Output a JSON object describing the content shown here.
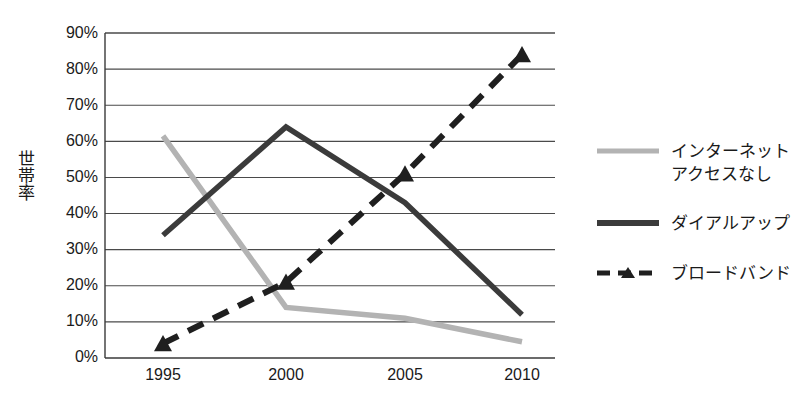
{
  "chart_data": {
    "type": "line",
    "title": "",
    "xlabel": "",
    "ylabel": "世帯率",
    "categories": [
      "1995",
      "2000",
      "2005",
      "2010"
    ],
    "ylim": [
      0,
      90
    ],
    "ytick_labels": [
      "0%",
      "10%",
      "20%",
      "30%",
      "40%",
      "50%",
      "60%",
      "70%",
      "80%",
      "90%"
    ],
    "ytick_values": [
      0,
      10,
      20,
      30,
      40,
      50,
      60,
      70,
      80,
      90
    ],
    "grid": "horizontal",
    "legend_position": "right",
    "value_suffix": "%",
    "series": [
      {
        "name": "インターネット\nアクセスなし",
        "name_flat": "インターネットアクセスなし",
        "color": "#b3b3b3",
        "style": "solid",
        "marker": "none",
        "values": [
          61.5,
          14,
          11,
          4.5
        ]
      },
      {
        "name": "ダイアルアップ",
        "name_flat": "ダイアルアップ",
        "color": "#3b3b3b",
        "style": "solid",
        "marker": "none",
        "values": [
          34,
          64,
          43,
          12
        ]
      },
      {
        "name": "ブロードバンド",
        "name_flat": "ブロードバンド",
        "color": "#1f1f1f",
        "style": "dashed",
        "marker": "triangle",
        "values": [
          4,
          21,
          51,
          84
        ]
      }
    ]
  },
  "axis": {
    "x_labels": [
      "1995",
      "2000",
      "2005",
      "2010"
    ],
    "y_labels": [
      "90%",
      "80%",
      "70%",
      "60%",
      "50%",
      "40%",
      "30%",
      "20%",
      "10%",
      "0%"
    ],
    "y_title": "世帯率"
  },
  "legend": {
    "items": [
      {
        "label": "インターネット\nアクセスなし",
        "color": "#b3b3b3",
        "style": "solid",
        "marker": "none"
      },
      {
        "label": "ダイアルアップ",
        "color": "#3b3b3b",
        "style": "solid",
        "marker": "none"
      },
      {
        "label": "ブロードバンド",
        "color": "#1f1f1f",
        "style": "dashed",
        "marker": "triangle"
      }
    ]
  },
  "colors": {
    "background": "#ffffff",
    "gridline": "#4a4a4a",
    "axis": "#3a3a3a",
    "text": "#1a1a1a",
    "series_no_internet": "#b3b3b3",
    "series_dialup": "#3b3b3b",
    "series_broadband": "#1f1f1f"
  }
}
